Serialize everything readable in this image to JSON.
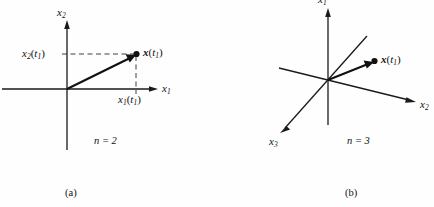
{
  "figure": {
    "background_color": "#fefefe",
    "line_color": "#1a1a1a",
    "vector_color": "#111111"
  },
  "panels": [
    {
      "id": "a",
      "caption": "(a)",
      "dimension_note": "n = 2",
      "axes": [
        {
          "name": "x2-axis",
          "label": "x",
          "sub": "2",
          "direction": "vertical-up"
        },
        {
          "name": "x1-axis",
          "label": "x",
          "sub": "1",
          "direction": "horizontal-right"
        }
      ],
      "point": {
        "name": "state-point",
        "label_main": "x",
        "label_paren_open": "(",
        "label_t": "t",
        "label_t_sub": "1",
        "label_paren_close": ")"
      },
      "projections": [
        {
          "name": "x2-projection-label",
          "label": "x",
          "sub": "2",
          "arg": "t",
          "arg_sub": "1"
        },
        {
          "name": "x1-projection-label",
          "label": "x",
          "sub": "1",
          "arg": "t",
          "arg_sub": "1"
        }
      ]
    },
    {
      "id": "b",
      "caption": "(b)",
      "dimension_note": "n = 3",
      "axes": [
        {
          "name": "x1-axis",
          "label": "x",
          "sub": "1",
          "direction": "vertical-up"
        },
        {
          "name": "x2-axis",
          "label": "x",
          "sub": "2",
          "direction": "oblique-right-down"
        },
        {
          "name": "x3-axis",
          "label": "x",
          "sub": "3",
          "direction": "oblique-left-down"
        }
      ],
      "point": {
        "name": "state-point",
        "label_main": "x",
        "label_paren_open": "(",
        "label_t": "t",
        "label_t_sub": "1",
        "label_paren_close": ")"
      }
    }
  ],
  "text": {
    "a": {
      "axis_vertical": "x",
      "axis_vertical_sub": "2",
      "axis_horizontal": "x",
      "axis_horizontal_sub": "1",
      "proj_vertical": "x",
      "proj_vertical_sub": "2",
      "proj_vertical_arg": "t",
      "proj_vertical_arg_sub": "1",
      "proj_horizontal": "x",
      "proj_horizontal_sub": "1",
      "proj_horizontal_arg": "t",
      "proj_horizontal_arg_sub": "1",
      "vector_label": "x",
      "vector_arg": "t",
      "vector_arg_sub": "1",
      "n_value": "n = 2",
      "caption": "(a)"
    },
    "b": {
      "axis_x1": "x",
      "axis_x1_sub": "1",
      "axis_x2": "x",
      "axis_x2_sub": "2",
      "axis_x3": "x",
      "axis_x3_sub": "3",
      "vector_label": "x",
      "vector_arg": "t",
      "vector_arg_sub": "1",
      "n_value": "n = 3",
      "caption": "(b)"
    }
  }
}
